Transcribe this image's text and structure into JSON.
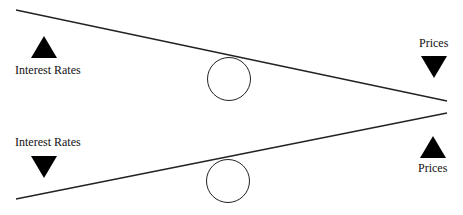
{
  "diagram": {
    "top_panel": {
      "left_label": "Interest Rates",
      "left_arrow": "up-triangle-icon",
      "right_label": "Prices",
      "right_arrow": "down-triangle-icon"
    },
    "bottom_panel": {
      "left_label": "Interest Rates",
      "left_arrow": "down-triangle-icon",
      "right_label": "Prices",
      "right_arrow": "up-triangle-icon"
    },
    "colors": {
      "line": "#222222",
      "arrow": "#000000",
      "background": "#ffffff"
    }
  }
}
